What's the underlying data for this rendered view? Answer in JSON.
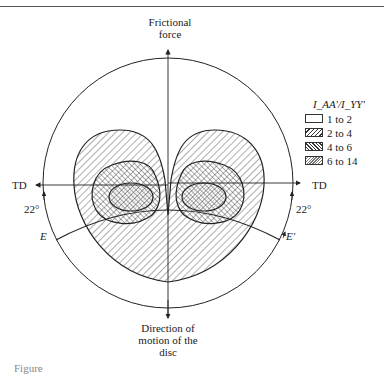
{
  "figure": {
    "top_label_line1": "Frictional",
    "top_label_line2": "force",
    "bottom_label_line1": "Direction of",
    "bottom_label_line2": "motion of the",
    "bottom_label_line3": "disc",
    "td_left": "TD",
    "td_right": "TD",
    "angle_left": "22°",
    "angle_right": "22°",
    "e_left": "E",
    "e_right": "E'",
    "caption": "Figure"
  },
  "legend": {
    "title": "I_AA'/I_YY'",
    "items": [
      {
        "label": "1 to 2",
        "pattern": "blank"
      },
      {
        "label": "2 to 4",
        "pattern": "wide-diagonal"
      },
      {
        "label": "4 to 6",
        "pattern": "back-diagonal"
      },
      {
        "label": "6 to 14",
        "pattern": "dense-diagonal"
      }
    ]
  },
  "colors": {
    "line": "#222222",
    "background": "#ffffff"
  }
}
